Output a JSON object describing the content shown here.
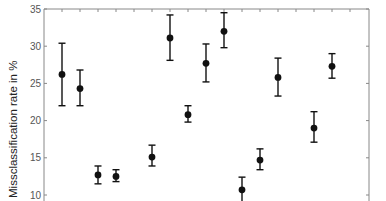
{
  "chart_data": {
    "type": "scatter",
    "subtype": "errorbar",
    "title": "",
    "xlabel": "",
    "ylabel": "Missclassification rate in %",
    "ylim": [
      10,
      35
    ],
    "yticks": [
      10,
      15,
      20,
      25,
      30,
      35
    ],
    "grid": false,
    "legend": null,
    "x": [
      1,
      2,
      3,
      4,
      6,
      7,
      8,
      9,
      10,
      11,
      12,
      13,
      15,
      16
    ],
    "values": [
      26.2,
      24.3,
      12.7,
      12.5,
      15.1,
      31.1,
      20.8,
      27.7,
      32.0,
      10.7,
      14.7,
      25.8,
      19.0,
      27.3
    ],
    "error_low": [
      22.0,
      22.0,
      11.5,
      11.8,
      13.9,
      28.1,
      19.8,
      25.2,
      29.8,
      9.0,
      13.4,
      23.3,
      17.1,
      25.7
    ],
    "error_high": [
      30.4,
      26.8,
      13.9,
      13.4,
      16.7,
      34.2,
      22.0,
      30.3,
      34.5,
      12.4,
      16.2,
      28.4,
      21.2,
      29.0
    ],
    "xlim": [
      0,
      18
    ],
    "n_top_ticks": 17
  },
  "layout": {
    "plot_left": 44,
    "plot_right": 369,
    "plot_top": 9,
    "plot_bottom_value_px": 195,
    "x_step_px": 18,
    "x0_px": 44
  }
}
